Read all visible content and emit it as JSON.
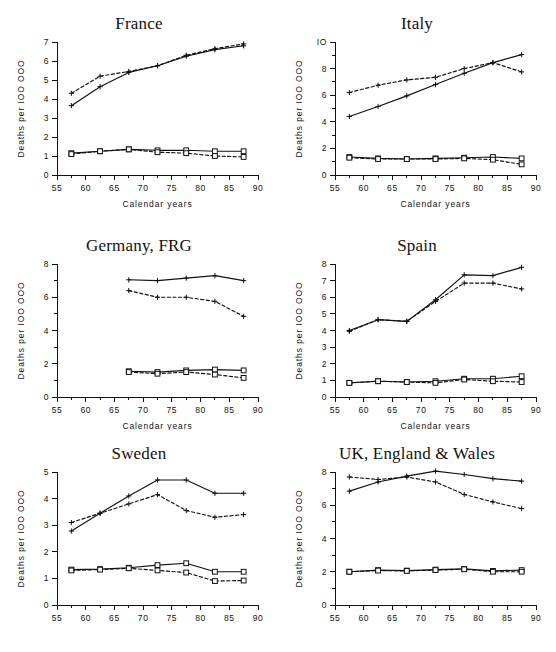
{
  "figure": {
    "layout": "2 columns x 3 rows of line charts",
    "shared_ylabel": "Deaths per IOO OOO",
    "shared_xlabel": "Calendar years",
    "line_color": "#111111",
    "background": "#ffffff",
    "marker_plus": "plus-marker",
    "marker_square": "open-square-marker"
  },
  "chart_data": [
    {
      "type": "line",
      "title": "France",
      "xlabel": "Calendar years",
      "ylabel": "Deaths per IOO OOO",
      "xlim": [
        55,
        90
      ],
      "ylim": [
        0,
        7
      ],
      "xticks": [
        55,
        60,
        65,
        70,
        75,
        80,
        85,
        90
      ],
      "yticks": [
        0,
        1,
        2,
        3,
        4,
        5,
        6,
        7
      ],
      "ytick_labels": [
        "0",
        "1",
        "2",
        "3",
        "4",
        "5",
        "6",
        "7"
      ],
      "grid": false,
      "legend": "none",
      "x": [
        57.5,
        62.5,
        67.5,
        72.5,
        77.5,
        82.5,
        87.5
      ],
      "series": [
        {
          "name": "male solid",
          "style": "solid",
          "marker": "plus",
          "values": [
            3.65,
            4.65,
            5.4,
            5.75,
            6.25,
            6.6,
            6.8
          ]
        },
        {
          "name": "male dashed",
          "style": "dashed",
          "marker": "plus",
          "values": [
            4.3,
            5.2,
            5.45,
            5.75,
            6.3,
            6.65,
            6.9
          ]
        },
        {
          "name": "female solid",
          "style": "solid",
          "marker": "square",
          "values": [
            1.15,
            1.25,
            1.35,
            1.3,
            1.3,
            1.25,
            1.25
          ]
        },
        {
          "name": "female dashed",
          "style": "dashed",
          "marker": "square",
          "values": [
            1.1,
            1.25,
            1.35,
            1.2,
            1.15,
            1.0,
            0.95
          ]
        }
      ]
    },
    {
      "type": "line",
      "title": "Italy",
      "xlabel": "Calendar years",
      "ylabel": "Deaths per IOO OOO",
      "xlim": [
        55,
        90
      ],
      "ylim": [
        0,
        10
      ],
      "xticks": [
        55,
        60,
        65,
        70,
        75,
        80,
        85,
        90
      ],
      "yticks": [
        0,
        1,
        2,
        3,
        4,
        5,
        6,
        7,
        8,
        9,
        10
      ],
      "ytick_labels": [
        "0",
        "",
        "2",
        "",
        "4",
        "",
        "6",
        "",
        "8",
        "",
        "IO"
      ],
      "grid": false,
      "legend": "none",
      "x": [
        57.5,
        62.5,
        67.5,
        72.5,
        77.5,
        82.5,
        87.5
      ],
      "series": [
        {
          "name": "male solid",
          "style": "solid",
          "marker": "plus",
          "values": [
            4.4,
            5.15,
            5.95,
            6.8,
            7.65,
            8.45,
            9.05
          ]
        },
        {
          "name": "male dashed",
          "style": "dashed",
          "marker": "plus",
          "values": [
            6.2,
            6.75,
            7.15,
            7.35,
            8.0,
            8.45,
            7.75
          ]
        },
        {
          "name": "female solid",
          "style": "solid",
          "marker": "square",
          "values": [
            1.35,
            1.25,
            1.2,
            1.25,
            1.3,
            1.35,
            1.25
          ]
        },
        {
          "name": "female dashed",
          "style": "dashed",
          "marker": "square",
          "values": [
            1.3,
            1.2,
            1.2,
            1.2,
            1.25,
            1.15,
            0.8
          ]
        }
      ]
    },
    {
      "type": "line",
      "title": "Germany, FRG",
      "xlabel": "Calendar years",
      "ylabel": "Deaths per IOO OOO",
      "xlim": [
        55,
        90
      ],
      "ylim": [
        0,
        8
      ],
      "xticks": [
        55,
        60,
        65,
        70,
        75,
        80,
        85,
        90
      ],
      "yticks": [
        0,
        1,
        2,
        3,
        4,
        5,
        6,
        7,
        8
      ],
      "ytick_labels": [
        "0",
        "",
        "2",
        "",
        "4",
        "",
        "6",
        "",
        "8"
      ],
      "grid": false,
      "legend": "none",
      "x": [
        67.5,
        72.5,
        77.5,
        82.5,
        87.5
      ],
      "series": [
        {
          "name": "male solid",
          "style": "solid",
          "marker": "plus",
          "values": [
            7.05,
            7.0,
            7.15,
            7.3,
            7.0
          ]
        },
        {
          "name": "male dashed",
          "style": "dashed",
          "marker": "plus",
          "values": [
            6.4,
            6.0,
            6.0,
            5.75,
            4.85
          ]
        },
        {
          "name": "female solid",
          "style": "solid",
          "marker": "square",
          "values": [
            1.55,
            1.5,
            1.6,
            1.65,
            1.6
          ]
        },
        {
          "name": "female dashed",
          "style": "dashed",
          "marker": "square",
          "values": [
            1.5,
            1.4,
            1.5,
            1.35,
            1.15
          ]
        }
      ]
    },
    {
      "type": "line",
      "title": "Spain",
      "xlabel": "Calendar years",
      "ylabel": "Deaths per IOO OOO",
      "xlim": [
        55,
        90
      ],
      "ylim": [
        0,
        8
      ],
      "xticks": [
        55,
        60,
        65,
        70,
        75,
        80,
        85,
        90
      ],
      "yticks": [
        0,
        1,
        2,
        3,
        4,
        5,
        6,
        7,
        8
      ],
      "ytick_labels": [
        "0",
        "1",
        "2",
        "3",
        "4",
        "5",
        "6",
        "7",
        "8"
      ],
      "grid": false,
      "legend": "none",
      "x": [
        57.5,
        62.5,
        67.5,
        72.5,
        77.5,
        82.5,
        87.5
      ],
      "series": [
        {
          "name": "male solid",
          "style": "solid",
          "marker": "plus",
          "values": [
            4.0,
            4.65,
            4.55,
            5.85,
            7.35,
            7.3,
            7.8
          ]
        },
        {
          "name": "male dashed",
          "style": "dashed",
          "marker": "plus",
          "values": [
            3.95,
            4.65,
            4.55,
            5.75,
            6.85,
            6.85,
            6.5
          ]
        },
        {
          "name": "female solid",
          "style": "solid",
          "marker": "square",
          "values": [
            0.85,
            0.95,
            0.9,
            0.95,
            1.1,
            1.1,
            1.25
          ]
        },
        {
          "name": "female dashed",
          "style": "dashed",
          "marker": "square",
          "values": [
            0.85,
            0.95,
            0.9,
            0.85,
            1.05,
            0.95,
            0.9
          ]
        }
      ]
    },
    {
      "type": "line",
      "title": "Sweden",
      "xlabel": "",
      "ylabel": "Deaths per IOO OOO",
      "xlim": [
        55,
        90
      ],
      "ylim": [
        0,
        5
      ],
      "xticks": [
        55,
        60,
        65,
        70,
        75,
        80,
        85,
        90
      ],
      "yticks": [
        0,
        1,
        2,
        3,
        4,
        5
      ],
      "ytick_labels": [
        "0",
        "1",
        "2",
        "3",
        "4",
        "5"
      ],
      "grid": false,
      "legend": "none",
      "x": [
        57.5,
        62.5,
        67.5,
        72.5,
        77.5,
        82.5,
        87.5
      ],
      "series": [
        {
          "name": "male solid",
          "style": "solid",
          "marker": "plus",
          "values": [
            2.78,
            3.45,
            4.1,
            4.7,
            4.7,
            4.2,
            4.2
          ]
        },
        {
          "name": "male dashed",
          "style": "dashed",
          "marker": "plus",
          "values": [
            3.1,
            3.45,
            3.8,
            4.15,
            3.55,
            3.3,
            3.4
          ]
        },
        {
          "name": "female solid",
          "style": "solid",
          "marker": "square",
          "values": [
            1.33,
            1.35,
            1.4,
            1.5,
            1.57,
            1.25,
            1.25
          ]
        },
        {
          "name": "female dashed",
          "style": "dashed",
          "marker": "square",
          "values": [
            1.3,
            1.33,
            1.38,
            1.3,
            1.22,
            0.9,
            0.92
          ]
        }
      ]
    },
    {
      "type": "line",
      "title": "UK, England & Wales",
      "xlabel": "",
      "ylabel": "Deaths per IOO OOO",
      "xlim": [
        55,
        90
      ],
      "ylim": [
        0,
        8
      ],
      "xticks": [
        55,
        60,
        65,
        70,
        75,
        80,
        85,
        90
      ],
      "yticks": [
        0,
        1,
        2,
        3,
        4,
        5,
        6,
        7,
        8
      ],
      "ytick_labels": [
        "0",
        "",
        "2",
        "",
        "4",
        "",
        "6",
        "",
        "8"
      ],
      "grid": false,
      "legend": "none",
      "x": [
        57.5,
        62.5,
        67.5,
        72.5,
        77.5,
        82.5,
        87.5
      ],
      "series": [
        {
          "name": "male solid",
          "style": "solid",
          "marker": "plus",
          "values": [
            6.85,
            7.4,
            7.75,
            8.05,
            7.85,
            7.6,
            7.45
          ]
        },
        {
          "name": "male dashed",
          "style": "dashed",
          "marker": "plus",
          "values": [
            7.7,
            7.55,
            7.7,
            7.4,
            6.65,
            6.2,
            5.8
          ]
        },
        {
          "name": "female solid",
          "style": "solid",
          "marker": "square",
          "values": [
            2.0,
            2.1,
            2.07,
            2.13,
            2.17,
            2.05,
            2.1
          ]
        },
        {
          "name": "female dashed",
          "style": "dashed",
          "marker": "square",
          "values": [
            2.0,
            2.07,
            2.05,
            2.1,
            2.15,
            2.0,
            2.0
          ]
        }
      ]
    }
  ]
}
